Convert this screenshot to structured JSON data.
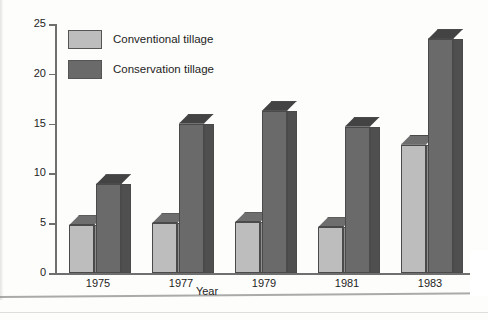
{
  "chart_data": {
    "type": "bar",
    "title": "",
    "xlabel": "Year",
    "ylabel": "Nitrate nitrogen in drainage water (mg/L)",
    "categories": [
      "1975",
      "1977",
      "1979",
      "1981",
      "1983"
    ],
    "series": [
      {
        "name": "Conventional tillage",
        "values": [
          4.8,
          5.0,
          5.1,
          4.6,
          12.9
        ],
        "color": "#bdbdbd"
      },
      {
        "name": "Conservation tillage",
        "values": [
          8.9,
          15.0,
          16.3,
          14.7,
          23.5
        ],
        "color": "#6a6a6a"
      }
    ],
    "ylim": [
      0,
      25
    ],
    "yticks": [
      "0",
      "5",
      "10",
      "15",
      "20",
      "25"
    ],
    "grid": false,
    "legend_position": "top-left",
    "style": "3d-bar"
  },
  "legend": {
    "items": [
      {
        "label": "Conventional tillage",
        "swatch": "light-gray-swatch"
      },
      {
        "label": "Conservation tillage",
        "swatch": "dark-gray-swatch"
      }
    ]
  }
}
